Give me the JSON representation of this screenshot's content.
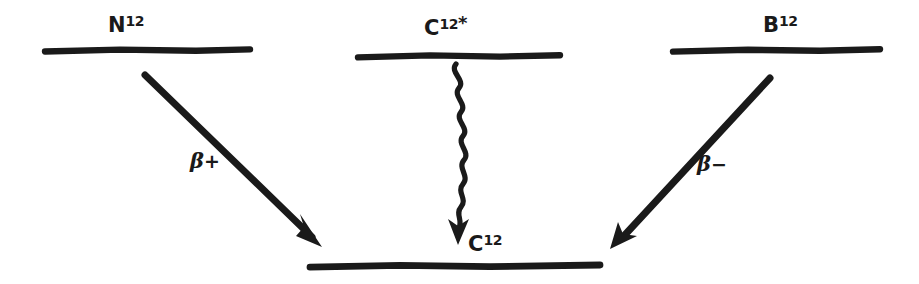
{
  "figure": {
    "kind": "nuclear-decay-level-scheme",
    "background_color": "#ffffff",
    "ink_color": "#1a1a1a",
    "levels": [
      {
        "id": "n12",
        "element": "N",
        "mass_number": "12",
        "excitation_marker": "",
        "label_text": "N12",
        "position": "upper-left",
        "line": {
          "x1": 45,
          "x2": 250,
          "y": 50
        }
      },
      {
        "id": "c12-excited",
        "element": "C",
        "mass_number": "12",
        "excitation_marker": "*",
        "label_text": "C12*",
        "position": "upper-center",
        "line": {
          "x1": 358,
          "x2": 560,
          "y": 56
        }
      },
      {
        "id": "b12",
        "element": "B",
        "mass_number": "12",
        "excitation_marker": "",
        "label_text": "B12",
        "position": "upper-right",
        "line": {
          "x1": 673,
          "x2": 880,
          "y": 50
        }
      },
      {
        "id": "c12-ground",
        "element": "C",
        "mass_number": "12",
        "excitation_marker": "",
        "label_text": "C12",
        "position": "bottom-center",
        "line": {
          "x1": 310,
          "x2": 600,
          "y": 266
        }
      }
    ],
    "transitions": [
      {
        "id": "beta-plus",
        "label_greek": "β",
        "label_sign": "+",
        "from_level": "n12",
        "to_level": "c12-ground",
        "style": "straight-arrow",
        "direction": "down-right",
        "x1": 145,
        "y1": 75,
        "x2": 320,
        "y2": 245
      },
      {
        "id": "gamma",
        "label_greek": "",
        "label_sign": "",
        "from_level": "c12-excited",
        "to_level": "c12-ground",
        "style": "wavy-arrow",
        "direction": "down",
        "x1": 458,
        "y1": 64,
        "x2": 458,
        "y2": 240
      },
      {
        "id": "beta-minus",
        "label_greek": "β",
        "label_sign": "−",
        "from_level": "b12",
        "to_level": "c12-ground",
        "style": "straight-arrow",
        "direction": "down-left",
        "x1": 770,
        "y1": 78,
        "x2": 612,
        "y2": 247
      }
    ]
  }
}
